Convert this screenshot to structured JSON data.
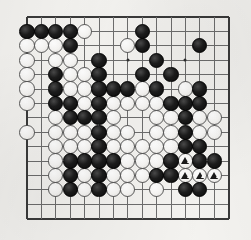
{
  "diagram": {
    "title": "Go board position",
    "type": "go-board-diagram",
    "board_size": 19,
    "visible_columns": 15,
    "visible_rows": 15,
    "geometry": {
      "origin_x": 27,
      "origin_y": 17,
      "spacing": 14.4,
      "stone_radius": 7.6
    },
    "colors": {
      "paper": "#f4f3f0",
      "grid": "#6d6d6d",
      "edge": "#3a3a3a",
      "black_stone": "#0a0a0a",
      "white_stone": "#ffffff",
      "white_stone_outline": "#5a5a5a",
      "mark": "#1a1a1a"
    },
    "star_points": [
      {
        "col": 3,
        "row": 3
      },
      {
        "col": 7,
        "row": 3
      },
      {
        "col": 11,
        "row": 3
      },
      {
        "col": 7,
        "row": 10
      }
    ],
    "edges": {
      "top": true,
      "left": true,
      "bottom": true,
      "right": true
    },
    "black_stones": [
      {
        "col": 0,
        "row": 1
      },
      {
        "col": 1,
        "row": 1
      },
      {
        "col": 2,
        "row": 1
      },
      {
        "col": 3,
        "row": 1
      },
      {
        "col": 8,
        "row": 1
      },
      {
        "col": 3,
        "row": 2
      },
      {
        "col": 8,
        "row": 2
      },
      {
        "col": 12,
        "row": 2
      },
      {
        "col": 5,
        "row": 3
      },
      {
        "col": 9,
        "row": 3
      },
      {
        "col": 2,
        "row": 4
      },
      {
        "col": 5,
        "row": 4
      },
      {
        "col": 8,
        "row": 4
      },
      {
        "col": 10,
        "row": 4
      },
      {
        "col": 2,
        "row": 5
      },
      {
        "col": 5,
        "row": 5
      },
      {
        "col": 6,
        "row": 5
      },
      {
        "col": 7,
        "row": 5
      },
      {
        "col": 9,
        "row": 5
      },
      {
        "col": 12,
        "row": 5
      },
      {
        "col": 2,
        "row": 6
      },
      {
        "col": 3,
        "row": 6
      },
      {
        "col": 5,
        "row": 6
      },
      {
        "col": 10,
        "row": 6
      },
      {
        "col": 11,
        "row": 6
      },
      {
        "col": 12,
        "row": 6
      },
      {
        "col": 3,
        "row": 7
      },
      {
        "col": 4,
        "row": 7
      },
      {
        "col": 5,
        "row": 7
      },
      {
        "col": 11,
        "row": 7
      },
      {
        "col": 5,
        "row": 8
      },
      {
        "col": 11,
        "row": 8
      },
      {
        "col": 5,
        "row": 9
      },
      {
        "col": 11,
        "row": 9
      },
      {
        "col": 12,
        "row": 9
      },
      {
        "col": 3,
        "row": 10
      },
      {
        "col": 4,
        "row": 10
      },
      {
        "col": 5,
        "row": 10
      },
      {
        "col": 6,
        "row": 10
      },
      {
        "col": 10,
        "row": 10
      },
      {
        "col": 12,
        "row": 10
      },
      {
        "col": 13,
        "row": 10
      },
      {
        "col": 3,
        "row": 11
      },
      {
        "col": 5,
        "row": 11
      },
      {
        "col": 9,
        "row": 11
      },
      {
        "col": 10,
        "row": 11
      },
      {
        "col": 3,
        "row": 12
      },
      {
        "col": 5,
        "row": 12
      },
      {
        "col": 11,
        "row": 12
      },
      {
        "col": 12,
        "row": 12
      }
    ],
    "white_stones": [
      {
        "col": 4,
        "row": 1
      },
      {
        "col": 0,
        "row": 2
      },
      {
        "col": 1,
        "row": 2
      },
      {
        "col": 2,
        "row": 2
      },
      {
        "col": 7,
        "row": 2
      },
      {
        "col": 0,
        "row": 3
      },
      {
        "col": 2,
        "row": 3
      },
      {
        "col": 3,
        "row": 3
      },
      {
        "col": 0,
        "row": 4
      },
      {
        "col": 3,
        "row": 4
      },
      {
        "col": 4,
        "row": 4
      },
      {
        "col": 0,
        "row": 5
      },
      {
        "col": 3,
        "row": 5
      },
      {
        "col": 4,
        "row": 5
      },
      {
        "col": 8,
        "row": 5
      },
      {
        "col": 11,
        "row": 5
      },
      {
        "col": 0,
        "row": 6
      },
      {
        "col": 4,
        "row": 6
      },
      {
        "col": 6,
        "row": 6
      },
      {
        "col": 7,
        "row": 6
      },
      {
        "col": 8,
        "row": 6
      },
      {
        "col": 9,
        "row": 6
      },
      {
        "col": 2,
        "row": 7
      },
      {
        "col": 6,
        "row": 7
      },
      {
        "col": 9,
        "row": 7
      },
      {
        "col": 10,
        "row": 7
      },
      {
        "col": 12,
        "row": 7
      },
      {
        "col": 13,
        "row": 7
      },
      {
        "col": 0,
        "row": 8
      },
      {
        "col": 2,
        "row": 8
      },
      {
        "col": 3,
        "row": 8
      },
      {
        "col": 4,
        "row": 8
      },
      {
        "col": 6,
        "row": 8
      },
      {
        "col": 7,
        "row": 8
      },
      {
        "col": 9,
        "row": 8
      },
      {
        "col": 10,
        "row": 8
      },
      {
        "col": 12,
        "row": 8
      },
      {
        "col": 13,
        "row": 8
      },
      {
        "col": 2,
        "row": 9
      },
      {
        "col": 3,
        "row": 9
      },
      {
        "col": 4,
        "row": 9
      },
      {
        "col": 6,
        "row": 9
      },
      {
        "col": 7,
        "row": 9
      },
      {
        "col": 8,
        "row": 9
      },
      {
        "col": 9,
        "row": 9
      },
      {
        "col": 10,
        "row": 9
      },
      {
        "col": 2,
        "row": 10
      },
      {
        "col": 7,
        "row": 10
      },
      {
        "col": 8,
        "row": 10
      },
      {
        "col": 9,
        "row": 10
      },
      {
        "col": 11,
        "row": 10
      },
      {
        "col": 2,
        "row": 11
      },
      {
        "col": 4,
        "row": 11
      },
      {
        "col": 6,
        "row": 11
      },
      {
        "col": 7,
        "row": 11
      },
      {
        "col": 8,
        "row": 11
      },
      {
        "col": 11,
        "row": 11
      },
      {
        "col": 12,
        "row": 11
      },
      {
        "col": 13,
        "row": 11
      },
      {
        "col": 2,
        "row": 12
      },
      {
        "col": 4,
        "row": 12
      },
      {
        "col": 6,
        "row": 12
      },
      {
        "col": 7,
        "row": 12
      },
      {
        "col": 9,
        "row": 12
      }
    ],
    "marked_white_stones": [
      {
        "col": 11,
        "row": 10,
        "mark": "triangle"
      },
      {
        "col": 11,
        "row": 11,
        "mark": "triangle"
      },
      {
        "col": 12,
        "row": 11,
        "mark": "triangle"
      },
      {
        "col": 13,
        "row": 11,
        "mark": "triangle"
      }
    ],
    "mark_symbol": "triangle",
    "mark_count": 4
  }
}
